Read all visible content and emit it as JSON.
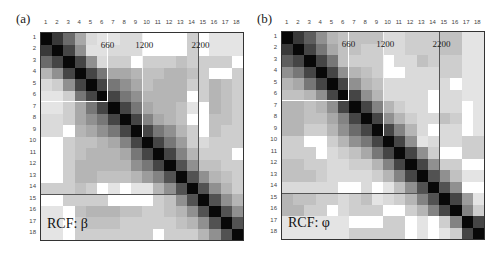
{
  "figure": {
    "panels": [
      {
        "label": "(a)",
        "caption": "RCF:  β",
        "annotations": [
          "660",
          "1200",
          "2200"
        ]
      },
      {
        "label": "(b)",
        "caption": "RCF:  φ",
        "annotations": [
          "660",
          "1200",
          "2200"
        ]
      }
    ]
  },
  "chart_data": [
    {
      "type": "heatmap",
      "title": "RCF: β",
      "panel": "(a)",
      "x_tick_labels": [
        "1",
        "2",
        "3",
        "4",
        "5",
        "6",
        "7",
        "8",
        "9",
        "10",
        "11",
        "12",
        "13",
        "14",
        "15",
        "16",
        "17",
        "18"
      ],
      "y_tick_labels": [
        "1",
        "2",
        "3",
        "4",
        "5",
        "6",
        "7",
        "8",
        "9",
        "10",
        "11",
        "12",
        "13",
        "14",
        "15",
        "16",
        "17",
        "18"
      ],
      "scale": "grayscale darkness 0 (white) to 1 (black); 'd' = light stippled cell",
      "boundaries": {
        "vertical_after_col": {
          "660": 6,
          "1200": 9,
          "2200": 14
        },
        "horizontal_after_row": [
          14
        ],
        "box_rows_cols": [
          6,
          6
        ]
      },
      "matrix": [
        [
          1,
          0.8,
          0.6,
          0.35,
          0.15,
          "d",
          "d",
          0.15,
          0.15,
          0,
          0,
          0,
          0,
          0.2,
          0,
          "d",
          "d",
          "d"
        ],
        [
          0.8,
          1,
          0.75,
          0.45,
          0.12,
          0.12,
          0.15,
          0.15,
          0.15,
          0,
          0,
          0,
          0,
          0.2,
          0,
          "d",
          "d",
          "d"
        ],
        [
          0.6,
          0.75,
          1,
          0.75,
          0.45,
          0.15,
          0.2,
          0.2,
          0,
          0.2,
          0.2,
          0.2,
          0.25,
          0.2,
          0.2,
          0.2,
          0.2,
          0
        ],
        [
          0.3,
          0.45,
          0.75,
          1,
          0.75,
          0.55,
          0.35,
          0.35,
          0.3,
          0.25,
          0.25,
          0.3,
          0.3,
          0.25,
          0.2,
          0,
          0,
          0.2
        ],
        [
          0.15,
          0.2,
          0.45,
          0.75,
          1,
          0.75,
          0.55,
          0.45,
          0.35,
          0.25,
          0.3,
          0.3,
          0.3,
          0.2,
          0.2,
          0.3,
          0.25,
          0.2
        ],
        [
          "d",
          "d",
          0.2,
          0.55,
          0.75,
          1,
          0.75,
          0.55,
          0.45,
          0.3,
          0.3,
          0.3,
          0.3,
          0,
          0.2,
          0.3,
          0.25,
          0.2
        ],
        [
          "d",
          "d",
          0.2,
          0.35,
          0.55,
          0.75,
          1,
          0.75,
          0.55,
          0.35,
          0.3,
          0.3,
          0.25,
          "d",
          0,
          0.3,
          0.25,
          0.2
        ],
        [
          0.15,
          0.15,
          0.2,
          0.35,
          0.45,
          0.55,
          0.75,
          1,
          0.75,
          0.5,
          0.35,
          0.3,
          0.25,
          0,
          0,
          0.25,
          0.25,
          0.2
        ],
        [
          0.15,
          0.15,
          0,
          0.3,
          0.35,
          0.45,
          0.55,
          0.75,
          1,
          0.75,
          0.55,
          0.45,
          0.3,
          0.2,
          0,
          0.25,
          0.2,
          0.2
        ],
        [
          0,
          0,
          0.2,
          0.25,
          0.25,
          0.3,
          0.35,
          0.5,
          0.75,
          1,
          0.75,
          0.55,
          0.4,
          0.2,
          0.15,
          0.2,
          0.2,
          0.2
        ],
        [
          0,
          0,
          0.2,
          0.25,
          0.3,
          0.3,
          0.3,
          0.35,
          0.55,
          0.75,
          1,
          0.75,
          0.5,
          0.3,
          0.2,
          0.2,
          0.2,
          0
        ],
        [
          0,
          0,
          0.2,
          0.3,
          0.3,
          0.3,
          0.3,
          0.3,
          0.45,
          0.55,
          0.75,
          1,
          0.7,
          0.45,
          0.25,
          0.25,
          0.2,
          0.2
        ],
        [
          0,
          0,
          0.2,
          0.3,
          0.3,
          0.25,
          0.25,
          0.25,
          0.3,
          0.4,
          0.5,
          0.7,
          1,
          0.7,
          0.45,
          0.3,
          0.25,
          0.2
        ],
        [
          0.2,
          0.2,
          0.2,
          0.25,
          0.2,
          0,
          "d",
          0,
          "d",
          "d",
          0.3,
          0.45,
          0.7,
          1,
          0.7,
          0.45,
          0.3,
          0.2
        ],
        [
          0,
          0,
          0.2,
          0.2,
          0.2,
          0.2,
          0,
          0,
          0,
          0,
          0.2,
          0.25,
          0.45,
          0.7,
          1,
          0.7,
          0.45,
          0.3
        ],
        [
          "d",
          "d",
          0,
          0.25,
          0.3,
          0.3,
          0.3,
          0.25,
          0.25,
          0.2,
          0.2,
          0.25,
          0.3,
          0.45,
          0.7,
          1,
          0.7,
          0.45
        ],
        [
          "d",
          "d",
          0,
          0.2,
          0.25,
          0.25,
          0.25,
          0.2,
          0.2,
          0.2,
          0.2,
          0.2,
          0.25,
          0.3,
          0.45,
          0.7,
          1,
          0.7
        ],
        [
          "d",
          "d",
          0,
          0.2,
          0.2,
          0.2,
          0.2,
          0.2,
          0.2,
          0.2,
          0,
          0.2,
          0.2,
          0.2,
          0.3,
          0.45,
          0.7,
          1
        ]
      ]
    },
    {
      "type": "heatmap",
      "title": "RCF: φ",
      "panel": "(b)",
      "x_tick_labels": [
        "1",
        "2",
        "3",
        "4",
        "5",
        "6",
        "7",
        "8",
        "9",
        "10",
        "11",
        "12",
        "13",
        "14",
        "15",
        "16",
        "17",
        "18"
      ],
      "y_tick_labels": [
        "1",
        "2",
        "3",
        "4",
        "5",
        "6",
        "7",
        "8",
        "9",
        "10",
        "11",
        "12",
        "13",
        "14",
        "15",
        "16",
        "17",
        "18"
      ],
      "scale": "grayscale darkness 0 (white) to 1 (black); 'd' = light stippled cell",
      "boundaries": {
        "vertical_after_col": {
          "660": 6,
          "1200": 9,
          "2200": 14
        },
        "horizontal_after_row": [
          14
        ],
        "box_rows_cols": [
          6,
          6
        ]
      },
      "matrix": [
        [
          1,
          0.8,
          0.65,
          0.45,
          0.3,
          0.25,
          0.25,
          0.25,
          0.25,
          0.15,
          0.15,
          0.2,
          0.2,
          0.2,
          0.25,
          0.25,
          "d",
          "d"
        ],
        [
          0.8,
          1,
          0.75,
          0.55,
          0.35,
          0.25,
          0.25,
          0.2,
          0.2,
          0.15,
          0.15,
          0.2,
          0.2,
          0.2,
          0.25,
          0.25,
          "d",
          "d"
        ],
        [
          0.65,
          0.75,
          1,
          0.75,
          0.55,
          0.25,
          0.2,
          0.2,
          0.2,
          0,
          0.15,
          0.15,
          0.25,
          0.2,
          0.2,
          0.2,
          "d",
          "d"
        ],
        [
          0.45,
          0.55,
          0.75,
          1,
          0.75,
          0.45,
          0.3,
          0.25,
          0.2,
          0,
          0,
          0.15,
          0.15,
          0.15,
          0.2,
          0.2,
          "d",
          "d"
        ],
        [
          0.3,
          0.35,
          0.55,
          0.75,
          1,
          0.75,
          0.45,
          0.3,
          0.25,
          0.15,
          0.15,
          0.15,
          0.15,
          0.15,
          0.15,
          0,
          "d",
          "d"
        ],
        [
          0.25,
          0.25,
          0.3,
          0.45,
          0.75,
          1,
          0.75,
          0.45,
          0.3,
          0.15,
          0.15,
          0.15,
          0.15,
          0,
          0.15,
          0.15,
          "d",
          "d"
        ],
        [
          0.3,
          0.3,
          0.25,
          0.3,
          0.45,
          0.75,
          1,
          0.75,
          0.5,
          0.3,
          0.2,
          0.15,
          0.15,
          0,
          0.15,
          0.15,
          0,
          "d"
        ],
        [
          0.3,
          0.3,
          0.25,
          0.25,
          0.35,
          0.5,
          0.75,
          1,
          0.75,
          0.45,
          0.3,
          0.2,
          0.15,
          0.15,
          0.25,
          0.2,
          0,
          "d"
        ],
        [
          0.3,
          0.3,
          0.2,
          0.2,
          0.3,
          0.45,
          0.6,
          0.75,
          1,
          0.75,
          0.5,
          0.3,
          0.15,
          0,
          0.15,
          0.15,
          0,
          "d"
        ],
        [
          0.2,
          0.2,
          0,
          0,
          0.2,
          0.3,
          0.45,
          0.55,
          0.75,
          1,
          0.75,
          0.45,
          "d",
          0.15,
          0.15,
          0.15,
          0.2,
          0.2
        ],
        [
          0.2,
          0.2,
          0.2,
          0,
          0.15,
          0.2,
          0.25,
          0.35,
          0.55,
          0.75,
          1,
          0.75,
          0.45,
          0.2,
          0,
          0,
          0.2,
          0.2
        ],
        [
          0.25,
          0.25,
          0.2,
          0.2,
          0.15,
          0.15,
          0.2,
          0.2,
          0.3,
          0.5,
          0.75,
          1,
          0.75,
          0.45,
          0.2,
          0.2,
          0,
          0
        ],
        [
          0.25,
          0.25,
          0.25,
          0.2,
          0.15,
          0.15,
          0.15,
          0.15,
          0.2,
          0.3,
          0.5,
          0.75,
          1,
          0.7,
          0.45,
          0.25,
          "d",
          "d"
        ],
        [
          0.15,
          0.15,
          0.15,
          0.15,
          0.15,
          0,
          0,
          0.15,
          0,
          "d",
          0.25,
          0.45,
          0.7,
          1,
          0.7,
          0.45,
          0,
          0
        ],
        [
          0.3,
          0.25,
          0.25,
          0.2,
          0.2,
          0.15,
          0.2,
          0.25,
          "d",
          0.15,
          0.2,
          0.3,
          0.5,
          0.7,
          1,
          0.75,
          0.4,
          "d"
        ],
        [
          0.3,
          0.3,
          0.2,
          0.2,
          0,
          0.15,
          0.2,
          0.2,
          0.2,
          0,
          0,
          0.2,
          0.3,
          0.5,
          0.75,
          1,
          0.5,
          0.2
        ],
        [
          "d",
          "d",
          "d",
          "d",
          "d",
          "d",
          0,
          0,
          0,
          0.2,
          0.2,
          0,
          "d",
          0,
          0.2,
          0.5,
          1,
          0.75
        ],
        [
          "d",
          "d",
          "d",
          "d",
          "d",
          "d",
          0.2,
          0.2,
          0.2,
          0.2,
          0.2,
          0,
          "d",
          0,
          "d",
          0.2,
          0.75,
          1
        ]
      ]
    }
  ]
}
